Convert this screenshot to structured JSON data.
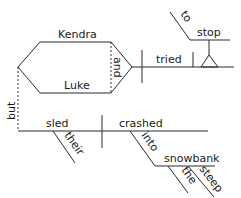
{
  "diagram": {
    "type": "sentence-diagram",
    "sentence": "Kendra and Luke tried to stop, but their sled crashed into the steep snowbank",
    "words": {
      "subject_top": "Kendra",
      "subject_bottom": "Luke",
      "conjunction_subjects": "and",
      "verb_main": "tried",
      "infinitive_marker": "to",
      "infinitive_verb": "stop",
      "conjunction_clauses": "but",
      "subject_2": "sled",
      "modifier_subject_2": "their",
      "verb_2": "crashed",
      "preposition": "into",
      "prep_object": "snowbank",
      "article": "the",
      "adjective": "steep"
    },
    "colors": {
      "line": "#2a2a2a",
      "text": "#1a1a1a",
      "background": "#ffffff"
    }
  }
}
